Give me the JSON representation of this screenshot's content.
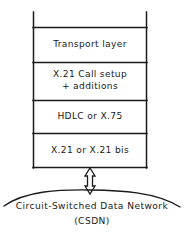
{
  "figure": {
    "line_color": "#1a1a1a",
    "background_color": "#ffffff",
    "text_color": "#1a1a1a"
  },
  "stack": {
    "layers": [
      {
        "id": "transport",
        "lines": [
          "Transport layer"
        ]
      },
      {
        "id": "call-setup",
        "lines": [
          "X.21 Call setup",
          "+ additions"
        ]
      },
      {
        "id": "data-link",
        "lines": [
          "HDLC or X.75"
        ]
      },
      {
        "id": "physical",
        "lines": [
          "X.21 or X.21 bis"
        ]
      }
    ]
  },
  "connector": {
    "icon": "double-headed-arrow-icon"
  },
  "network": {
    "name": "Circuit-Switched Data Network",
    "abbreviation": "(CSDN)"
  }
}
